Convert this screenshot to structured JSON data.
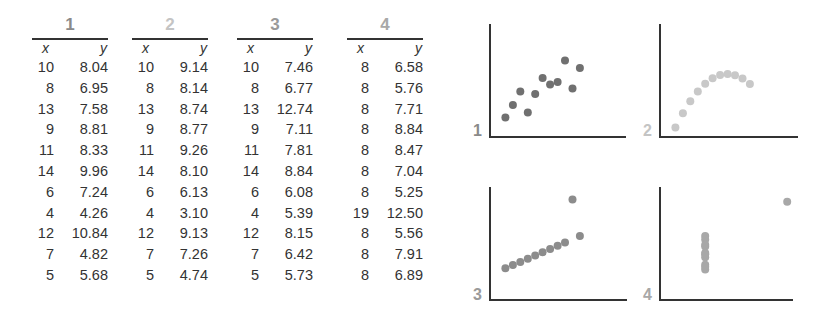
{
  "table": {
    "column_labels": {
      "x": "x",
      "y": "y"
    },
    "datasets": [
      {
        "label": "1",
        "color": "#8a8a8a",
        "x": [
          "10",
          "8",
          "13",
          "9",
          "11",
          "14",
          "6",
          "4",
          "12",
          "7",
          "5"
        ],
        "y": [
          "8.04",
          "6.95",
          "7.58",
          "8.81",
          "8.33",
          "9.96",
          "7.24",
          "4.26",
          "10.84",
          "4.82",
          "5.68"
        ]
      },
      {
        "label": "2",
        "color": "#c4c4c4",
        "x": [
          "10",
          "8",
          "13",
          "9",
          "11",
          "14",
          "6",
          "4",
          "12",
          "7",
          "5"
        ],
        "y": [
          "9.14",
          "8.14",
          "8.74",
          "8.77",
          "9.26",
          "8.10",
          "6.13",
          "3.10",
          "9.13",
          "7.26",
          "4.74"
        ]
      },
      {
        "label": "3",
        "color": "#9a9a9a",
        "x": [
          "10",
          "8",
          "13",
          "9",
          "11",
          "14",
          "6",
          "4",
          "12",
          "7",
          "5"
        ],
        "y": [
          "7.46",
          "6.77",
          "12.74",
          "7.11",
          "7.81",
          "8.84",
          "6.08",
          "5.39",
          "8.15",
          "6.42",
          "5.73"
        ]
      },
      {
        "label": "4",
        "color": "#a8a8a8",
        "x": [
          "8",
          "8",
          "8",
          "8",
          "8",
          "8",
          "8",
          "19",
          "8",
          "8",
          "8"
        ],
        "y": [
          "6.58",
          "5.76",
          "7.71",
          "8.84",
          "8.47",
          "7.04",
          "5.25",
          "12.50",
          "5.56",
          "7.91",
          "6.89"
        ]
      }
    ]
  },
  "chart_data": [
    {
      "type": "scatter",
      "title": "1",
      "xlabel": "",
      "ylabel": "",
      "xlim": [
        2,
        20
      ],
      "ylim": [
        2,
        14
      ],
      "grid": false,
      "color": "#707070",
      "x": [
        10,
        8,
        13,
        9,
        11,
        14,
        6,
        4,
        12,
        7,
        5
      ],
      "y": [
        8.04,
        6.95,
        7.58,
        8.81,
        8.33,
        9.96,
        7.24,
        4.26,
        10.84,
        4.82,
        5.68
      ]
    },
    {
      "type": "scatter",
      "title": "2",
      "xlabel": "",
      "ylabel": "",
      "xlim": [
        2,
        20
      ],
      "ylim": [
        2,
        14
      ],
      "grid": false,
      "color": "#c8c8c8",
      "x": [
        10,
        8,
        13,
        9,
        11,
        14,
        6,
        4,
        12,
        7,
        5
      ],
      "y": [
        9.14,
        8.14,
        8.74,
        8.77,
        9.26,
        8.1,
        6.13,
        3.1,
        9.13,
        7.26,
        4.74
      ]
    },
    {
      "type": "scatter",
      "title": "3",
      "xlabel": "",
      "ylabel": "",
      "xlim": [
        2,
        20
      ],
      "ylim": [
        2,
        14
      ],
      "grid": false,
      "color": "#8c8c8c",
      "x": [
        10,
        8,
        13,
        9,
        11,
        14,
        6,
        4,
        12,
        7,
        5
      ],
      "y": [
        7.46,
        6.77,
        12.74,
        7.11,
        7.81,
        8.84,
        6.08,
        5.39,
        8.15,
        6.42,
        5.73
      ]
    },
    {
      "type": "scatter",
      "title": "4",
      "xlabel": "",
      "ylabel": "",
      "xlim": [
        2,
        20
      ],
      "ylim": [
        2,
        14
      ],
      "grid": false,
      "color": "#a8a8a8",
      "x": [
        8,
        8,
        8,
        8,
        8,
        8,
        8,
        19,
        8,
        8,
        8
      ],
      "y": [
        6.58,
        5.76,
        7.71,
        8.84,
        8.47,
        7.04,
        5.25,
        12.5,
        5.56,
        7.91,
        6.89
      ]
    }
  ]
}
